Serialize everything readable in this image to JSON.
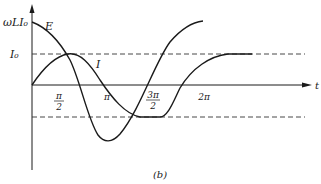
{
  "figure": {
    "caption": "(b)",
    "axes": {
      "x_label": "t",
      "y_tick_top": "ωLI₀",
      "y_tick_mid": "I₀"
    },
    "x_ticks": [
      {
        "label": "π/2",
        "num": "π",
        "den": "2"
      },
      {
        "label": "π"
      },
      {
        "label": "3π/2",
        "num": "3π",
        "den": "2"
      },
      {
        "label": "2π"
      }
    ],
    "curves": [
      {
        "name": "E",
        "label": "E"
      },
      {
        "name": "I",
        "label": "I"
      }
    ],
    "colors": {
      "ink": "#1a1a1a",
      "dash": "#333333"
    }
  }
}
